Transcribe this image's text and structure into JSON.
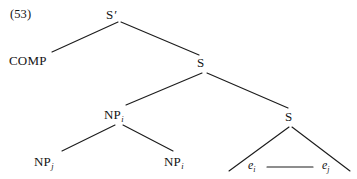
{
  "figure": {
    "example_number": "(53)",
    "type": "syntax-tree"
  },
  "nodes": {
    "root": {
      "label": "S",
      "prime": "′",
      "x": 112,
      "y": 16
    },
    "comp": {
      "label": "COMP",
      "x": 10,
      "y": 62
    },
    "s_upper": {
      "label": "S",
      "x": 200,
      "y": 64
    },
    "np_upper": {
      "label": "NP",
      "subscript": "i",
      "x": 115,
      "y": 116
    },
    "s_lower": {
      "label": "S",
      "x": 287,
      "y": 118
    },
    "np_left": {
      "label": "NP",
      "subscript": "j",
      "x": 44,
      "y": 163
    },
    "np_right": {
      "label": "NP",
      "subscript": "i",
      "x": 174,
      "y": 163
    },
    "trace_left": {
      "label": "e",
      "subscript": "i",
      "x": 250,
      "y": 168
    },
    "trace_right": {
      "label": "e",
      "subscript": "j",
      "x": 324,
      "y": 168
    }
  },
  "edges": [
    {
      "name": "sbar-to-comp",
      "from": "S'",
      "to": "COMP",
      "x1": 118,
      "y1": 22,
      "x2": 52,
      "y2": 52
    },
    {
      "name": "sbar-to-s",
      "from": "S'",
      "to": "S",
      "x1": 121,
      "y1": 22,
      "x2": 199,
      "y2": 55
    },
    {
      "name": "s-to-np",
      "from": "S",
      "to": "NP_i",
      "x1": 202,
      "y1": 72,
      "x2": 126,
      "y2": 105
    },
    {
      "name": "s-to-s",
      "from": "S",
      "to": "S",
      "x1": 206,
      "y1": 72,
      "x2": 288,
      "y2": 108
    },
    {
      "name": "np-to-npj",
      "from": "NP_i",
      "to": "NP_j",
      "x1": 115,
      "y1": 124,
      "x2": 62,
      "y2": 151
    },
    {
      "name": "np-to-npi",
      "from": "NP_i",
      "to": "NP_i",
      "x1": 122,
      "y1": 124,
      "x2": 172,
      "y2": 151
    },
    {
      "name": "triangle-left",
      "from": "S",
      "to": "e_i",
      "x1": 289,
      "y1": 126,
      "x2": 230,
      "y2": 171
    },
    {
      "name": "triangle-right",
      "from": "S",
      "to": "e_j",
      "x1": 291,
      "y1": 126,
      "x2": 349,
      "y2": 171
    },
    {
      "name": "triangle-base",
      "from": "e_i",
      "to": "e_j",
      "x1": 268,
      "y1": 168,
      "x2": 312,
      "y2": 168
    }
  ],
  "style": {
    "line_color": "#1c1c1c",
    "background": "#ffffff",
    "text_color": "#141414"
  }
}
